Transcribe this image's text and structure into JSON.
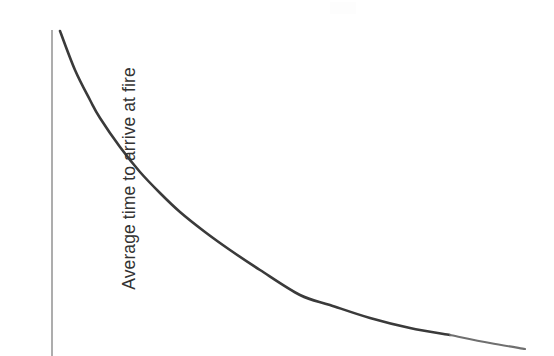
{
  "chart_data": {
    "type": "line",
    "title": "",
    "subtitle": "",
    "xlabel": "",
    "ylabel": "Average time to arrive at fire",
    "legend": [],
    "annotations": [],
    "grid": false,
    "legend_position": "none",
    "axes": {
      "y_axis_visible": true,
      "x_axis_visible": false,
      "y_tick_labels": [],
      "x_tick_labels": [],
      "y_axis_line_color": "#8a8a8a"
    },
    "series": [
      {
        "name": "Average time to arrive at fire",
        "color": "#3a3a3a",
        "line_width": 2.6,
        "shape": "decaying-exponential",
        "points": [
          {
            "x": 60,
            "y": 31
          },
          {
            "x": 75,
            "y": 70
          },
          {
            "x": 90,
            "y": 100
          },
          {
            "x": 100,
            "y": 118
          },
          {
            "x": 120,
            "y": 147
          },
          {
            "x": 140,
            "y": 172
          },
          {
            "x": 160,
            "y": 193
          },
          {
            "x": 180,
            "y": 212
          },
          {
            "x": 205,
            "y": 232
          },
          {
            "x": 230,
            "y": 250
          },
          {
            "x": 260,
            "y": 270
          },
          {
            "x": 300,
            "y": 295
          },
          {
            "x": 330,
            "y": 305
          },
          {
            "x": 370,
            "y": 318
          },
          {
            "x": 410,
            "y": 328
          },
          {
            "x": 450,
            "y": 335
          },
          {
            "x": 490,
            "y": 343
          },
          {
            "x": 525,
            "y": 349
          }
        ]
      }
    ]
  },
  "figure": {
    "background_color": "#ffffff",
    "width": 554,
    "height": 356,
    "y_axis_label": "Average time to arrive at fire",
    "curve_color": "#3a3a3a",
    "axis_color": "#8a8a8a"
  }
}
